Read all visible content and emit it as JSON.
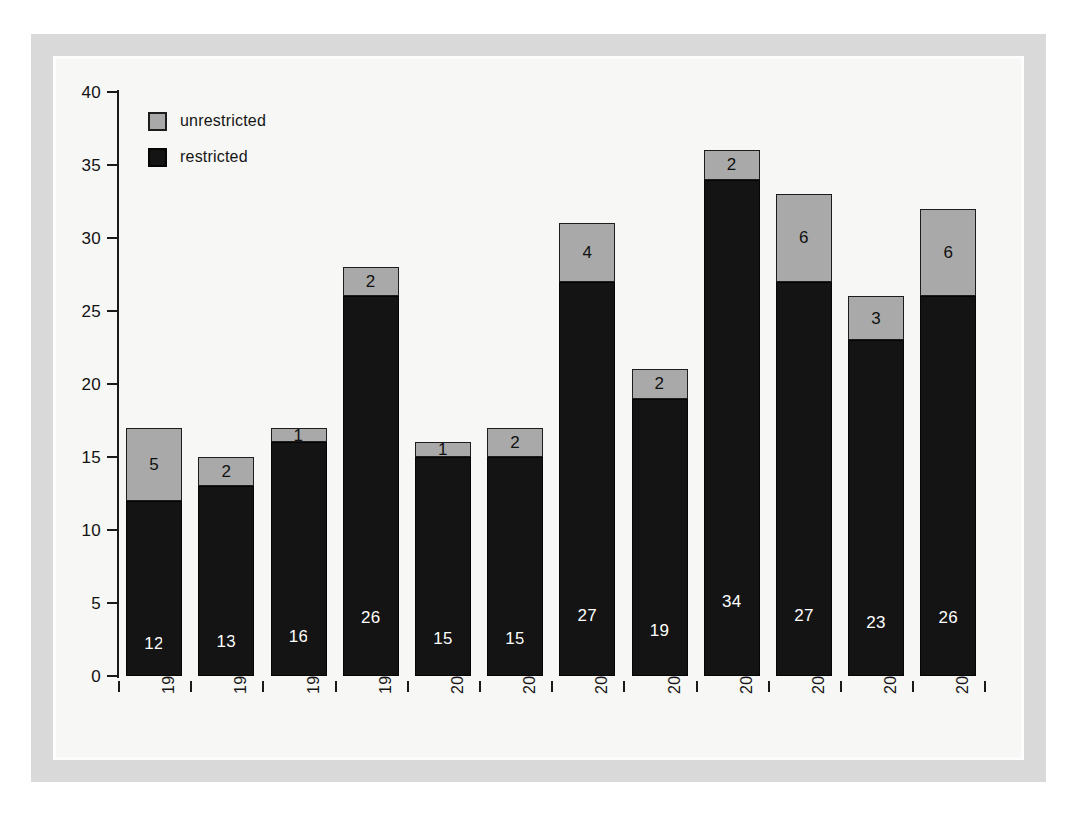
{
  "chart_data": {
    "type": "bar",
    "stacked": true,
    "title": "",
    "subtitle": "",
    "xlabel": "",
    "ylabel": "",
    "ylim": [
      0,
      40
    ],
    "yticks": [
      0,
      5,
      10,
      15,
      20,
      25,
      30,
      35,
      40
    ],
    "ytick_labels": [
      "0",
      "5",
      "10",
      "15",
      "20",
      "25",
      "30",
      "35",
      "40"
    ],
    "grid": false,
    "legend_position": "top-left",
    "categories": [
      "1996/97",
      "1997/98",
      "1998/99",
      "1999/00",
      "2000/01",
      "2001/02",
      "2002/03",
      "2003/04",
      "2004/05",
      "2005/06",
      "2006/07",
      "2007/08"
    ],
    "series": [
      {
        "name": "restricted",
        "color": "#141414",
        "values": [
          12,
          13,
          16,
          26,
          15,
          15,
          27,
          19,
          34,
          27,
          23,
          26
        ]
      },
      {
        "name": "unrestricted",
        "color": "#a9a9a9",
        "values": [
          5,
          2,
          1,
          2,
          1,
          2,
          4,
          2,
          2,
          6,
          3,
          6
        ]
      }
    ],
    "totals": [
      17,
      15,
      17,
      28,
      16,
      17,
      31,
      21,
      36,
      33,
      26,
      32
    ],
    "data_labels": true
  },
  "legend": {
    "items": [
      {
        "label": "unrestricted",
        "swatch": "unrestricted"
      },
      {
        "label": "restricted",
        "swatch": "restricted"
      }
    ]
  },
  "colors": {
    "restricted": "#141414",
    "unrestricted": "#a9a9a9",
    "frame": "#d9d9d9",
    "plot_background": "#f7f7f5",
    "axis": "#1a1a1a",
    "page_background": "#ffffff"
  }
}
